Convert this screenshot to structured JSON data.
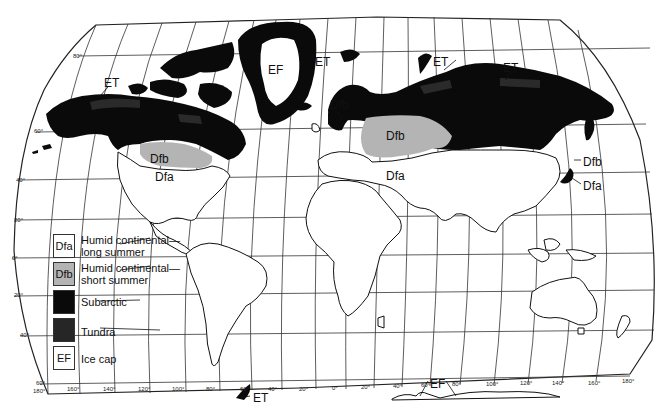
{
  "map": {
    "title": "Humid continental, subarctic, tundra and ice cap climates",
    "colors": {
      "dfa": "#ffffff",
      "dfb": "#b4b4b4",
      "subarctic": "#0a0a0a",
      "tundra": "#2c2c2c",
      "ice_cap": "#ffffff",
      "land_outline": "#111111",
      "graticule": "#333333"
    },
    "region_labels": [
      {
        "id": "et-alaska",
        "text": "ET",
        "x": 104,
        "y": 77
      },
      {
        "id": "dfb-na",
        "text": "Dfb",
        "x": 150,
        "y": 153
      },
      {
        "id": "dfa-na",
        "text": "Dfa",
        "x": 155,
        "y": 171
      },
      {
        "id": "ef-greenland",
        "text": "EF",
        "x": 268,
        "y": 64
      },
      {
        "id": "et-greenland",
        "text": "ET",
        "x": 315,
        "y": 56
      },
      {
        "id": "dfb-scandinavia",
        "text": "Dfb",
        "x": 330,
        "y": 99
      },
      {
        "id": "dfb-russia",
        "text": "Dfb",
        "x": 386,
        "y": 130
      },
      {
        "id": "dfa-europe",
        "text": "Dfa",
        "x": 386,
        "y": 170
      },
      {
        "id": "et-russia-west",
        "text": "ET",
        "x": 433,
        "y": 56
      },
      {
        "id": "et-russia-east",
        "text": "ET",
        "x": 503,
        "y": 62
      },
      {
        "id": "dfb-asia",
        "text": "Dfb",
        "x": 583,
        "y": 156
      },
      {
        "id": "dfa-asia",
        "text": "Dfa",
        "x": 583,
        "y": 180
      },
      {
        "id": "et-antarctica-peninsula",
        "text": "ET",
        "x": 253,
        "y": 394
      },
      {
        "id": "ef-antarctica",
        "text": "EF",
        "x": 435,
        "y": 381
      }
    ],
    "latitude_ticks": [
      {
        "text": "80°",
        "x": 73,
        "y": 57
      },
      {
        "text": "60°",
        "x": 34,
        "y": 131
      },
      {
        "text": "40°",
        "x": 16,
        "y": 180
      },
      {
        "text": "20°",
        "x": 14,
        "y": 220
      },
      {
        "text": "0°",
        "x": 12,
        "y": 258
      },
      {
        "text": "20°",
        "x": 14,
        "y": 295
      },
      {
        "text": "40°",
        "x": 20,
        "y": 335
      },
      {
        "text": "60°",
        "x": 36,
        "y": 383
      }
    ],
    "longitude_ticks": [
      {
        "text": "180°",
        "x": 33,
        "y": 388
      },
      {
        "text": "160°",
        "x": 67,
        "y": 386
      },
      {
        "text": "140°",
        "x": 103,
        "y": 386
      },
      {
        "text": "120°",
        "x": 138,
        "y": 386
      },
      {
        "text": "100°",
        "x": 172,
        "y": 386
      },
      {
        "text": "80°",
        "x": 206,
        "y": 386
      },
      {
        "text": "60°",
        "x": 240,
        "y": 386
      },
      {
        "text": "40°",
        "x": 268,
        "y": 386
      },
      {
        "text": "20°",
        "x": 299,
        "y": 386
      },
      {
        "text": "0°",
        "x": 332,
        "y": 385
      },
      {
        "text": "20°",
        "x": 361,
        "y": 384
      },
      {
        "text": "40°",
        "x": 393,
        "y": 383
      },
      {
        "text": "60°",
        "x": 421,
        "y": 382
      },
      {
        "text": "80°",
        "x": 452,
        "y": 381
      },
      {
        "text": "100°",
        "x": 486,
        "y": 381
      },
      {
        "text": "120°",
        "x": 520,
        "y": 380
      },
      {
        "text": "140°",
        "x": 552,
        "y": 380
      },
      {
        "text": "160°",
        "x": 588,
        "y": 380
      },
      {
        "text": "180°",
        "x": 622,
        "y": 378
      }
    ]
  },
  "legend": {
    "items": [
      {
        "code": "Dfa",
        "label_line1": "Humid continental—",
        "label_line2": "long summer",
        "swatch": "#ffffff"
      },
      {
        "code": "Dfb",
        "label_line1": "Humid continental—",
        "label_line2": "short summer",
        "swatch": "#b4b4b4"
      },
      {
        "code": "",
        "label_line1": "Subarctic",
        "label_line2": "",
        "swatch": "#0a0a0a"
      },
      {
        "code": "",
        "label_line1": "Tundra",
        "label_line2": "",
        "swatch": "#262626"
      },
      {
        "code": "EF",
        "label_line1": "Ice cap",
        "label_line2": "",
        "swatch": "#ffffff"
      }
    ]
  }
}
